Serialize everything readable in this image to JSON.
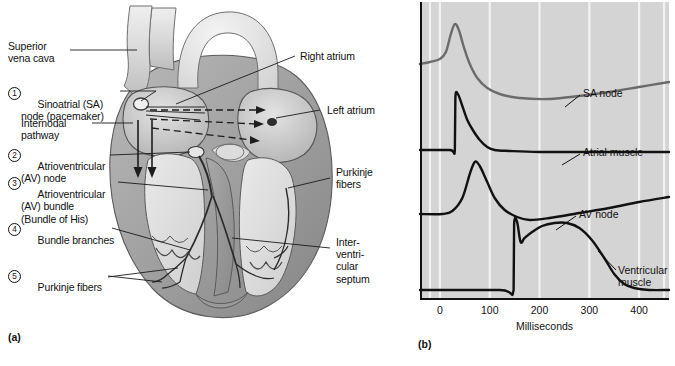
{
  "figure": {
    "panel_a_tag": "(a)",
    "panel_b_tag": "(b)"
  },
  "panel_a": {
    "title_semantic": "cardiac-conduction-system",
    "labels_left": [
      {
        "id": "superior-vena-cava",
        "text": "Superior\nvena cava",
        "number": null
      },
      {
        "id": "sa-node",
        "text": "Sinoatrial (SA)\nnode (pacemaker)",
        "number": "1"
      },
      {
        "id": "internodal-pathway",
        "text": "Internodal\npathway",
        "number": null
      },
      {
        "id": "av-node",
        "text": "Atrioventricular\n(AV) node",
        "number": "2"
      },
      {
        "id": "av-bundle",
        "text": "Atrioventricular\n(AV) bundle\n(Bundle of His)",
        "number": "3"
      },
      {
        "id": "bundle-branches",
        "text": "Bundle branches",
        "number": "4"
      },
      {
        "id": "purkinje-fibers-left",
        "text": "Purkinje fibers",
        "number": "5"
      }
    ],
    "labels_right": [
      {
        "id": "right-atrium",
        "text": "Right atrium"
      },
      {
        "id": "left-atrium",
        "text": "Left atrium"
      },
      {
        "id": "purkinje-fibers-right",
        "text": "Purkinje\nfibers"
      },
      {
        "id": "interventricular-septum",
        "text": "Inter-\nventri-\ncular\nseptum"
      }
    ]
  },
  "chart_data": {
    "type": "line",
    "title": "",
    "xlabel": "Milliseconds",
    "ylabel": "",
    "xlim": [
      -40,
      460
    ],
    "xticks": [
      0,
      100,
      200,
      300,
      400
    ],
    "xtick_labels": [
      "0",
      "100",
      "200",
      "300",
      "400"
    ],
    "grid": "vertical-white-gridlines",
    "background_color": "#d4d4d4",
    "gridline_color": "#f2f2f2",
    "legend_position": "inline-annotations",
    "series": [
      {
        "name": "SA node",
        "color": "#6b6b6b",
        "annotation": "SA node",
        "description": "pacemaker potential with slow diastolic depolarization, peak near 30 ms",
        "points": [
          [
            -40,
            62
          ],
          [
            -20,
            60
          ],
          [
            0,
            57
          ],
          [
            12,
            50
          ],
          [
            22,
            32
          ],
          [
            30,
            22
          ],
          [
            38,
            28
          ],
          [
            48,
            45
          ],
          [
            60,
            62
          ],
          [
            75,
            76
          ],
          [
            95,
            86
          ],
          [
            120,
            92
          ],
          [
            160,
            96
          ],
          [
            220,
            97
          ],
          [
            280,
            94
          ],
          [
            340,
            90
          ],
          [
            400,
            85
          ],
          [
            460,
            80
          ]
        ]
      },
      {
        "name": "Atrial muscle",
        "color": "#111111",
        "annotation": "Atrial muscle",
        "description": "fast upstroke at ~30 ms, rapid repolarization to flat baseline",
        "points": [
          [
            -40,
            148
          ],
          [
            20,
            148
          ],
          [
            30,
            148
          ],
          [
            31,
            96
          ],
          [
            36,
            92
          ],
          [
            45,
            104
          ],
          [
            55,
            118
          ],
          [
            66,
            128
          ],
          [
            80,
            138
          ],
          [
            95,
            145
          ],
          [
            110,
            148
          ],
          [
            140,
            149
          ],
          [
            200,
            150
          ],
          [
            300,
            150
          ],
          [
            400,
            150
          ],
          [
            460,
            150
          ]
        ]
      },
      {
        "name": "AV node",
        "color": "#111111",
        "annotation": "AV node",
        "description": "delayed slow-rising action potential peaking near 70 ms",
        "points": [
          [
            -40,
            212
          ],
          [
            5,
            212
          ],
          [
            25,
            209
          ],
          [
            45,
            196
          ],
          [
            60,
            172
          ],
          [
            70,
            160
          ],
          [
            80,
            164
          ],
          [
            95,
            180
          ],
          [
            110,
            196
          ],
          [
            130,
            208
          ],
          [
            155,
            215
          ],
          [
            180,
            218
          ],
          [
            220,
            216
          ],
          [
            280,
            211
          ],
          [
            340,
            206
          ],
          [
            400,
            200
          ],
          [
            460,
            195
          ]
        ]
      },
      {
        "name": "Ventricular muscle",
        "color": "#111111",
        "annotation": "Ventricular\nmuscle",
        "description": "rapid depolarization at 150 ms, long plateau, repolarization by ~380 ms",
        "points": [
          [
            -40,
            288
          ],
          [
            120,
            288
          ],
          [
            148,
            288
          ],
          [
            149,
            222
          ],
          [
            155,
            220
          ],
          [
            162,
            240
          ],
          [
            170,
            236
          ],
          [
            185,
            230
          ],
          [
            205,
            224
          ],
          [
            230,
            221
          ],
          [
            255,
            221
          ],
          [
            280,
            226
          ],
          [
            305,
            238
          ],
          [
            330,
            256
          ],
          [
            350,
            272
          ],
          [
            370,
            282
          ],
          [
            390,
            286
          ],
          [
            420,
            288
          ],
          [
            460,
            288
          ]
        ]
      }
    ]
  }
}
